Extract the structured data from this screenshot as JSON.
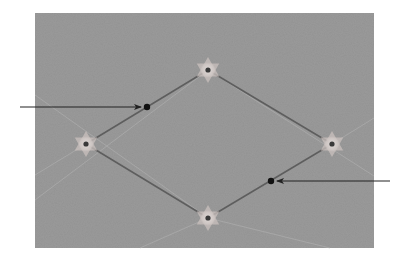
{
  "canvas": {
    "width": 410,
    "height": 259,
    "background": "#ffffff"
  },
  "panel": {
    "x": 35,
    "y": 13,
    "width": 339,
    "height": 235,
    "fill": "#9a9a9a",
    "fill_light": "#a4a4a4"
  },
  "guides": {
    "color": "#b4b4b4",
    "lines": [
      {
        "x1": 35,
        "y1": 200,
        "x2": 208,
        "y2": 70
      },
      {
        "x1": 208,
        "y1": 70,
        "x2": 374,
        "y2": 176
      },
      {
        "x1": 35,
        "y1": 95,
        "x2": 208,
        "y2": 218
      },
      {
        "x1": 208,
        "y1": 218,
        "x2": 330,
        "y2": 248
      },
      {
        "x1": 86,
        "y1": 144,
        "x2": 35,
        "y2": 175
      },
      {
        "x1": 332,
        "y1": 144,
        "x2": 374,
        "y2": 118
      },
      {
        "x1": 140,
        "y1": 248,
        "x2": 208,
        "y2": 218
      }
    ]
  },
  "path": {
    "color": "#5e5e5e",
    "width": 1.6,
    "vertices": [
      {
        "name": "top",
        "x": 208,
        "y": 70
      },
      {
        "name": "right",
        "x": 332,
        "y": 144
      },
      {
        "name": "bottom",
        "x": 208,
        "y": 218
      },
      {
        "name": "left",
        "x": 86,
        "y": 144
      }
    ]
  },
  "markers": {
    "star_color": "#c9c0bd",
    "star_alpha": 0.75,
    "glow_color": "#d8d2d0",
    "center_color": "#3a3a3a",
    "center_radius": 2.6,
    "star_size": 13
  },
  "points": [
    {
      "name": "upper-left-point",
      "x": 147,
      "y": 107,
      "radius": 3.2,
      "color": "#111111",
      "arrow": {
        "from_x": 20,
        "from_y": 107,
        "to_x": 141,
        "to_y": 107
      }
    },
    {
      "name": "lower-right-point",
      "x": 271,
      "y": 181,
      "radius": 3.2,
      "color": "#111111",
      "arrow": {
        "from_x": 390,
        "from_y": 181,
        "to_x": 277,
        "to_y": 181
      }
    }
  ],
  "arrow_color": "#222222"
}
